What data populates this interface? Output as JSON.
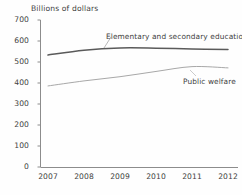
{
  "chart_data": {
    "type": "line",
    "title": "",
    "subtitle": "",
    "ylabel": "Billions of dollars",
    "xlabel": "",
    "ylim": [
      0,
      700
    ],
    "yticks": [
      0,
      100,
      200,
      300,
      400,
      500,
      600,
      700
    ],
    "ytick_labels": [
      "0",
      "100",
      "200",
      "300",
      "400",
      "500",
      "600",
      "700"
    ],
    "x": [
      2007,
      2008,
      2009,
      2010,
      2011,
      2012
    ],
    "xtick_labels": [
      "2007",
      "2008",
      "2009",
      "2010",
      "2011",
      "2012"
    ],
    "grid": false,
    "legend_position": "inline-annotations",
    "series": [
      {
        "name": "Elementary and secondary education",
        "color": "#5a5a5a",
        "values": [
          533,
          556,
          567,
          566,
          562,
          560
        ]
      },
      {
        "name": "Public welfare",
        "color": "#a8a8a8",
        "values": [
          386,
          410,
          430,
          455,
          478,
          472
        ]
      }
    ],
    "annotations": [
      {
        "text": "Elementary and secondary education",
        "series": "Elementary and secondary education"
      },
      {
        "text": "Public welfare",
        "series": "Public welfare"
      }
    ]
  },
  "axis": {
    "y_title": "Billions of dollars"
  }
}
